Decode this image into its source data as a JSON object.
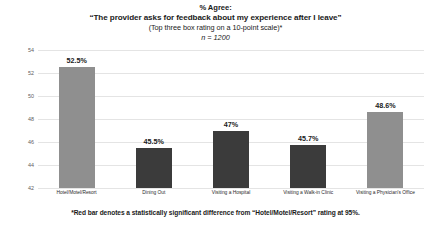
{
  "chart_data": {
    "type": "bar",
    "title": "% Agree:",
    "subtitle": "“The provider asks for feedback about my experience after I leave”",
    "subtitle2": "(Top three box rating on a 10-point scale)*",
    "sample_size": "n = 1200",
    "xlabel": "",
    "ylabel": "",
    "ylim": [
      42,
      54
    ],
    "yticks": [
      42,
      44,
      46,
      48,
      50,
      52,
      54
    ],
    "ytick_labels": [
      "42",
      "44",
      "46",
      "48",
      "50",
      "52",
      "54"
    ],
    "grid": true,
    "legend": "none",
    "categories": [
      "Hotel/Motel/Resort",
      "Dining Out",
      "Visiting a Hospital",
      "Visiting a Walk-in Clinic",
      "Visiting a Physician's Office"
    ],
    "values": [
      52.5,
      45.5,
      47,
      45.7,
      48.6
    ],
    "value_labels": [
      "52.5%",
      "45.5%",
      "47%",
      "45.7%",
      "48.6%"
    ],
    "bar_colors": [
      "#8f8f8f",
      "#3b3b3b",
      "#3b3b3b",
      "#3b3b3b",
      "#8f8f8f"
    ],
    "significant": [
      false,
      true,
      true,
      true,
      false
    ],
    "annotation": "*Red bar denotes a statistically significant difference from “Hotel/Motel/Resort” rating at 95%."
  },
  "colors": {
    "reference_bar": "#8f8f8f",
    "significant_bar": "#3b3b3b",
    "gridline": "#e4e4e4",
    "axis_text": "#5d5d5d",
    "background": "#ffffff"
  }
}
